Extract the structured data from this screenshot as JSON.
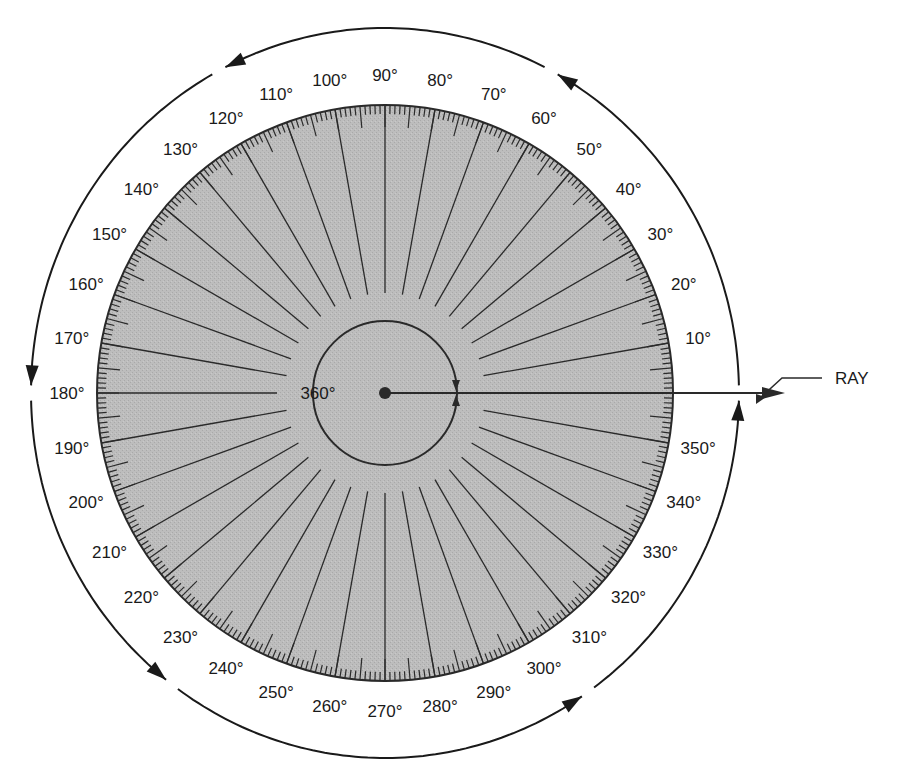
{
  "diagram": {
    "colors": {
      "disk_fill": "#b9b9b9",
      "line": "#2a2a2a",
      "text": "#1a1a1a",
      "background": "#ffffff"
    },
    "geometry": {
      "center": [
        385,
        393
      ],
      "disk_radius": 288,
      "inner_circle_radius": 72,
      "radial_line_start": 100,
      "outer_circle_rx": 354,
      "outer_circle_ry": 365,
      "label_radius": 318
    },
    "center_label": "360°",
    "ray_label": "RAY",
    "degree_labels": [
      {
        "angle": 10,
        "text": "10°"
      },
      {
        "angle": 20,
        "text": "20°"
      },
      {
        "angle": 30,
        "text": "30°"
      },
      {
        "angle": 40,
        "text": "40°"
      },
      {
        "angle": 50,
        "text": "50°"
      },
      {
        "angle": 60,
        "text": "60°"
      },
      {
        "angle": 70,
        "text": "70°"
      },
      {
        "angle": 80,
        "text": "80°"
      },
      {
        "angle": 90,
        "text": "90°"
      },
      {
        "angle": 100,
        "text": "100°"
      },
      {
        "angle": 110,
        "text": "110°"
      },
      {
        "angle": 120,
        "text": "120°"
      },
      {
        "angle": 130,
        "text": "130°"
      },
      {
        "angle": 140,
        "text": "140°"
      },
      {
        "angle": 150,
        "text": "150°"
      },
      {
        "angle": 160,
        "text": "160°"
      },
      {
        "angle": 170,
        "text": "170°"
      },
      {
        "angle": 180,
        "text": "180°"
      },
      {
        "angle": 190,
        "text": "190°"
      },
      {
        "angle": 200,
        "text": "200°"
      },
      {
        "angle": 210,
        "text": "210°"
      },
      {
        "angle": 220,
        "text": "220°"
      },
      {
        "angle": 230,
        "text": "230°"
      },
      {
        "angle": 240,
        "text": "240°"
      },
      {
        "angle": 250,
        "text": "250°"
      },
      {
        "angle": 260,
        "text": "260°"
      },
      {
        "angle": 270,
        "text": "270°"
      },
      {
        "angle": 280,
        "text": "280°"
      },
      {
        "angle": 290,
        "text": "290°"
      },
      {
        "angle": 300,
        "text": "300°"
      },
      {
        "angle": 310,
        "text": "310°"
      },
      {
        "angle": 320,
        "text": "320°"
      },
      {
        "angle": 330,
        "text": "330°"
      },
      {
        "angle": 340,
        "text": "340°"
      },
      {
        "angle": 350,
        "text": "350°"
      }
    ],
    "outer_arrow_angles": [
      62,
      118,
      180,
      233,
      305,
      360
    ]
  }
}
